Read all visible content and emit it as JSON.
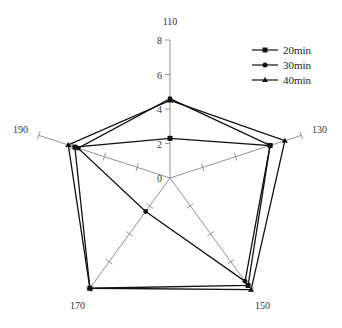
{
  "chart_data": {
    "type": "radar",
    "title": "",
    "axes": [
      "110",
      "130",
      "150",
      "170",
      "190"
    ],
    "radial_ticks": [
      "0",
      "2",
      "4",
      "6",
      "8"
    ],
    "rlim": [
      0,
      8
    ],
    "grid": false,
    "legend_position": "upper right",
    "series": [
      {
        "name": "20min",
        "marker": "square",
        "values": [
          2.3,
          6.1,
          7.7,
          7.9,
          5.8
        ]
      },
      {
        "name": "30min",
        "marker": "circle",
        "values": [
          4.6,
          6.1,
          7.4,
          2.4,
          5.6
        ]
      },
      {
        "name": "40min",
        "marker": "triangle",
        "values": [
          4.5,
          7.0,
          8.0,
          7.9,
          6.2
        ]
      }
    ]
  },
  "legend": {
    "items": [
      {
        "label": "20min"
      },
      {
        "label": "30min"
      },
      {
        "label": "40min"
      }
    ]
  },
  "colors": {
    "line": "#111111",
    "axis": "#666666"
  }
}
